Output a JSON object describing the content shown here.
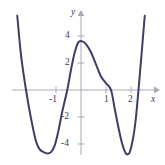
{
  "figure": {
    "background_color": "#ffffff",
    "curve_color": "#3d3d66",
    "axis_color": "#a9a9b8",
    "label_color": "#3a3a5c"
  },
  "axes": {
    "x_axis_label": "x",
    "y_axis_label": "y",
    "x_tick_labels": [
      "-1",
      "1",
      "2"
    ],
    "y_tick_labels": [
      "4",
      "2",
      "-2",
      "-4"
    ]
  },
  "chart_data": {
    "type": "line",
    "title": "",
    "xlabel": "x",
    "ylabel": "y",
    "xlim": [
      -2.9,
      2.95
    ],
    "ylim": [
      -5.9,
      5.55
    ],
    "grid": false,
    "legend": null,
    "x_ticks": [
      -1,
      1,
      2
    ],
    "y_ticks": [
      4,
      2,
      -2,
      -4
    ],
    "annotations": [],
    "series": [
      {
        "name": "quartic",
        "roots": [
          -1.65,
          -0.55,
          1.2,
          2.3
        ],
        "local_maximum": {
          "x": -0.1,
          "y": 3.6
        },
        "local_minima": [
          {
            "x": -1.2,
            "y": -4.6
          },
          {
            "x": 1.8,
            "y": -4.7
          }
        ],
        "x": [
          -2.55,
          -2.4,
          -2.2,
          -2.0,
          -1.8,
          -1.65,
          -1.5,
          -1.35,
          -1.2,
          -1.05,
          -0.9,
          -0.75,
          -0.55,
          -0.4,
          -0.25,
          -0.1,
          0.05,
          0.2,
          0.4,
          0.6,
          0.8,
          1.0,
          1.2,
          1.35,
          1.5,
          1.65,
          1.8,
          1.95,
          2.1,
          2.2,
          2.3,
          2.42,
          2.55
        ],
        "y": [
          5.5,
          2.6,
          0.0,
          -2.1,
          -3.8,
          -4.4,
          -4.6,
          -4.7,
          -4.6,
          -4.1,
          -3.0,
          -1.6,
          0.0,
          1.5,
          2.8,
          3.55,
          3.6,
          3.4,
          2.8,
          1.9,
          1.0,
          0.5,
          0.0,
          -1.4,
          -2.8,
          -4.0,
          -4.7,
          -4.6,
          -3.4,
          -2.0,
          0.0,
          2.6,
          5.5
        ]
      }
    ]
  }
}
